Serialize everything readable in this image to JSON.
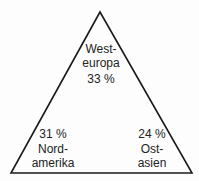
{
  "diagram": {
    "type": "triangle",
    "regions": [
      {
        "name": "Westeuropa",
        "lines": [
          "West-",
          "europa",
          "33 %"
        ],
        "value_percent": 33
      },
      {
        "name": "Nordamerika",
        "lines": [
          "31 %",
          "Nord-",
          "amerika"
        ],
        "value_percent": 31
      },
      {
        "name": "Ostasien",
        "lines": [
          "24 %",
          "Ost-",
          "asien"
        ],
        "value_percent": 24
      }
    ],
    "stroke_color": "#1a1a1a"
  }
}
